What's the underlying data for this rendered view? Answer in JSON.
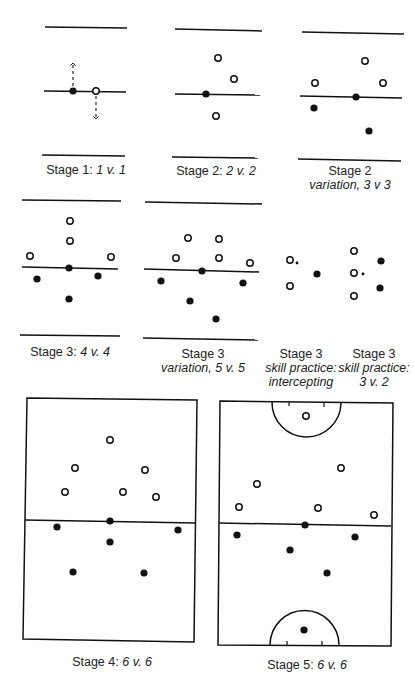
{
  "figure": {
    "colors": {
      "ink": "#111111",
      "paper": "#ffffff",
      "team_dark": "#111111",
      "team_light": "#ffffff"
    }
  },
  "legend": {
    "filled_circle": "dark team player",
    "open_circle": "light team player",
    "small_dot": "ball",
    "dashed_arrow": "direction of movement"
  },
  "panels": [
    {
      "id": "stage1",
      "caption_main": "Stage 1:",
      "caption_italic": "1 v. 1",
      "players_light": 1,
      "players_dark": 1
    },
    {
      "id": "stage2",
      "caption_main": "Stage 2:",
      "caption_italic": "2 v. 2",
      "players_light": 3,
      "players_dark": 1
    },
    {
      "id": "stage2var",
      "caption_main": "Stage 2",
      "caption_italic": "variation, 3 v 3",
      "players_light": 3,
      "players_dark": 3
    },
    {
      "id": "stage3",
      "caption_main": "Stage 3:",
      "caption_italic": "4 v. 4",
      "players_light": 4,
      "players_dark": 4
    },
    {
      "id": "stage3var",
      "caption_main": "Stage 3",
      "caption_italic": "variation, 5 v. 5",
      "players_light": 5,
      "players_dark": 5
    },
    {
      "id": "stage3int",
      "caption_main": "Stage 3",
      "caption_italic": "skill practice:",
      "caption_italic2": "intercepting",
      "players_light": 2,
      "players_dark": 1
    },
    {
      "id": "stage3v2",
      "caption_main": "Stage 3",
      "caption_italic": "skill practice:",
      "caption_italic2": "3 v. 2",
      "players_light": 3,
      "players_dark": 2
    },
    {
      "id": "stage4",
      "caption_main": "Stage 4:",
      "caption_italic": "6 v. 6",
      "players_light": 6,
      "players_dark": 6
    },
    {
      "id": "stage5",
      "caption_main": "Stage 5:",
      "caption_italic": "6 v. 6",
      "players_light": 6,
      "players_dark": 6
    }
  ]
}
